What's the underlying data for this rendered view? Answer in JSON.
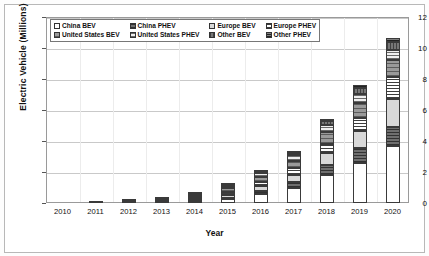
{
  "chart_data": {
    "type": "bar",
    "subtype": "stacked-bar",
    "title": "",
    "xlabel": "Year",
    "ylabel": "Electric Vehicle (Millions)",
    "categories": [
      "2010",
      "2011",
      "2012",
      "2013",
      "2014",
      "2015",
      "2016",
      "2017",
      "2018",
      "2019",
      "2020"
    ],
    "ylim": [
      0,
      12
    ],
    "yticks": [
      0,
      2,
      4,
      6,
      8,
      10,
      12
    ],
    "grid": true,
    "legend_position": "top-left-inside",
    "units": "Millions of vehicles",
    "series": [
      {
        "name": "China BEV",
        "key": "china_bev",
        "pattern": "white-solid",
        "color": "#ffffff",
        "values": [
          0.0,
          0.01,
          0.02,
          0.04,
          0.1,
          0.26,
          0.56,
          1.0,
          1.8,
          2.6,
          3.7
        ]
      },
      {
        "name": "China PHEV",
        "key": "china_phev",
        "pattern": "dark-horizontal-lines",
        "color": "#6f6f6f",
        "values": [
          0.0,
          0.0,
          0.01,
          0.01,
          0.03,
          0.09,
          0.2,
          0.35,
          0.65,
          0.95,
          1.2
        ]
      },
      {
        "name": "Europe BEV",
        "key": "europe_bev",
        "pattern": "light-gray-solid",
        "color": "#d8d8d8",
        "values": [
          0.0,
          0.01,
          0.02,
          0.05,
          0.11,
          0.19,
          0.31,
          0.48,
          0.75,
          1.1,
          1.8
        ]
      },
      {
        "name": "Europe PHEV",
        "key": "europe_phev",
        "pattern": "fine-horizontal-lines",
        "color": "#ffffff",
        "values": [
          0.0,
          0.0,
          0.01,
          0.03,
          0.08,
          0.16,
          0.26,
          0.4,
          0.62,
          0.85,
          1.4
        ]
      },
      {
        "name": "United States BEV",
        "key": "us_bev",
        "pattern": "gray-hatch",
        "color": "#9a9a9a",
        "values": [
          0.0,
          0.01,
          0.03,
          0.08,
          0.14,
          0.25,
          0.35,
          0.5,
          0.75,
          0.98,
          1.15
        ]
      },
      {
        "name": "United States PHEV",
        "key": "us_phev",
        "pattern": "light-horizontal-lines",
        "color": "#efefef",
        "values": [
          0.0,
          0.01,
          0.02,
          0.05,
          0.1,
          0.17,
          0.24,
          0.34,
          0.48,
          0.58,
          0.65
        ]
      },
      {
        "name": "Other BEV",
        "key": "other_bev",
        "pattern": "vertical-lines",
        "color": "#777777",
        "values": [
          0.0,
          0.0,
          0.01,
          0.02,
          0.04,
          0.07,
          0.1,
          0.16,
          0.25,
          0.35,
          0.48
        ]
      },
      {
        "name": "Other PHEV",
        "key": "other_phev",
        "pattern": "dense-crosshatch",
        "color": "#545454",
        "values": [
          0.0,
          0.0,
          0.0,
          0.01,
          0.02,
          0.03,
          0.05,
          0.08,
          0.12,
          0.18,
          0.25
        ]
      }
    ],
    "totals": [
      0.02,
      0.05,
      0.12,
      0.29,
      0.62,
      1.22,
      2.07,
      3.31,
      5.42,
      7.59,
      10.63
    ]
  },
  "axes": {
    "y_title": "Electric Vehicle (Millions)",
    "x_title": "Year",
    "y_tick_labels": [
      "0",
      "2",
      "4",
      "6",
      "8",
      "10",
      "12"
    ],
    "x_tick_labels": [
      "2010",
      "2011",
      "2012",
      "2013",
      "2014",
      "2015",
      "2016",
      "2017",
      "2018",
      "2019",
      "2020"
    ]
  },
  "legend": {
    "items": [
      {
        "label": "China BEV"
      },
      {
        "label": "China PHEV"
      },
      {
        "label": "Europe BEV"
      },
      {
        "label": "Europe PHEV"
      },
      {
        "label": "United States BEV"
      },
      {
        "label": "United States PHEV"
      },
      {
        "label": "Other BEV"
      },
      {
        "label": "Other PHEV"
      }
    ]
  }
}
